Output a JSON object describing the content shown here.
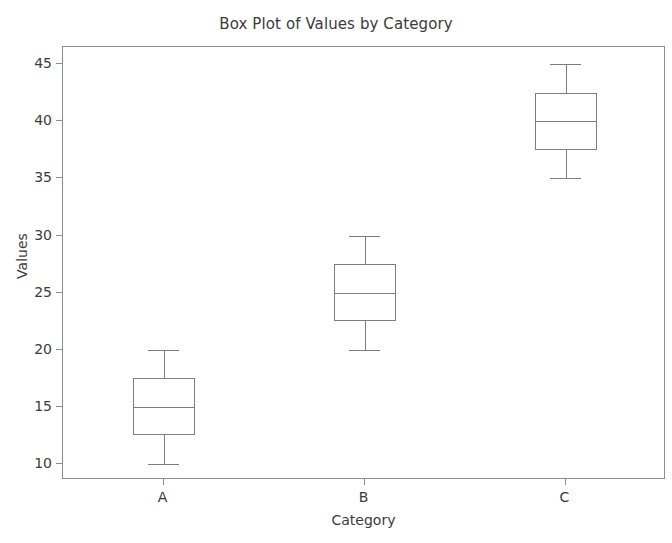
{
  "chart_data": {
    "type": "box",
    "title": "Box Plot of Values by Category",
    "xlabel": "Category",
    "ylabel": "Values",
    "categories": [
      "A",
      "B",
      "C"
    ],
    "ylim": [
      8.6,
      46.5
    ],
    "yticks": [
      10,
      15,
      20,
      25,
      30,
      35,
      40,
      45
    ],
    "ytick_labels": [
      "10",
      "15",
      "20",
      "25",
      "30",
      "35",
      "40",
      "45"
    ],
    "grid": false,
    "legend": null,
    "boxes": [
      {
        "category": "A",
        "whisker_low": 10.0,
        "q1": 12.5,
        "median": 15.0,
        "q3": 17.5,
        "whisker_high": 20.0,
        "outliers": []
      },
      {
        "category": "B",
        "whisker_low": 20.0,
        "q1": 22.5,
        "median": 25.0,
        "q3": 27.5,
        "whisker_high": 30.0,
        "outliers": []
      },
      {
        "category": "C",
        "whisker_low": 35.0,
        "q1": 37.5,
        "median": 40.0,
        "q3": 42.5,
        "whisker_high": 45.0,
        "outliers": []
      }
    ]
  },
  "style": {
    "line_color": "#7d7d7d",
    "axis_color": "#8d8d8d",
    "text_color": "#3b3b3b",
    "background": "#ffffff"
  }
}
